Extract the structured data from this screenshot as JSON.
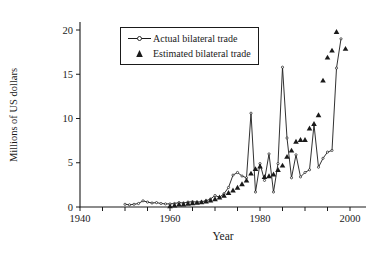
{
  "colors": {
    "ink": "#1a1a1a",
    "background": "#ffffff"
  },
  "legend": {
    "items": [
      {
        "label": "Actual bilateral trade",
        "symbol": "line-with-open-circle"
      },
      {
        "label": "Estimated bilateral trade",
        "symbol": "filled-triangle"
      }
    ],
    "position": "top-center-in-plot"
  },
  "chart_data": {
    "type": "line",
    "title": "",
    "xlabel": "Year",
    "ylabel": "Millions of US dollars",
    "grid": false,
    "x_axis": {
      "tick_labels": [
        "1940",
        "1960",
        "1980",
        "2000"
      ],
      "minor_ticks": [
        1940,
        1945,
        1950,
        1955,
        1960,
        1965,
        1970,
        1975,
        1980,
        1985,
        1990,
        1995,
        2000
      ],
      "range": [
        1940,
        2003
      ]
    },
    "y_axis": {
      "ticks": [
        0,
        5,
        10,
        15,
        20
      ],
      "range": [
        0,
        21
      ]
    },
    "series": [
      {
        "name": "Actual bilateral trade",
        "type": "line",
        "marker": "open-circle",
        "x": [
          1950,
          1951,
          1952,
          1953,
          1954,
          1955,
          1956,
          1957,
          1958,
          1959,
          1960,
          1961,
          1962,
          1963,
          1964,
          1965,
          1966,
          1967,
          1968,
          1969,
          1970,
          1971,
          1972,
          1973,
          1974,
          1975,
          1976,
          1977,
          1978,
          1979,
          1980,
          1981,
          1982,
          1983,
          1984,
          1985,
          1986,
          1987,
          1988,
          1989,
          1990,
          1991,
          1992,
          1993,
          1994,
          1995,
          1996,
          1997,
          1998
        ],
        "values": [
          0.3,
          0.25,
          0.3,
          0.4,
          0.7,
          0.55,
          0.45,
          0.5,
          0.4,
          0.35,
          0.35,
          0.4,
          0.5,
          0.45,
          0.55,
          0.6,
          0.55,
          0.6,
          0.7,
          0.9,
          1.3,
          1.1,
          1.5,
          2.2,
          3.6,
          3.9,
          3.5,
          3.3,
          10.6,
          1.7,
          4.9,
          3.0,
          6.0,
          1.7,
          4.9,
          15.8,
          7.8,
          3.3,
          5.9,
          3.4,
          3.9,
          4.2,
          9.3,
          4.5,
          5.5,
          6.2,
          6.4,
          15.7,
          19.0
        ]
      },
      {
        "name": "Estimated bilateral trade",
        "type": "scatter",
        "marker": "filled-triangle",
        "x": [
          1960,
          1961,
          1962,
          1963,
          1964,
          1965,
          1966,
          1967,
          1968,
          1969,
          1970,
          1971,
          1972,
          1973,
          1974,
          1975,
          1976,
          1977,
          1978,
          1979,
          1980,
          1981,
          1982,
          1983,
          1984,
          1985,
          1986,
          1987,
          1988,
          1989,
          1990,
          1991,
          1992,
          1993,
          1994,
          1995,
          1996,
          1997,
          1999
        ],
        "values": [
          0.1,
          0.2,
          0.3,
          0.3,
          0.4,
          0.45,
          0.5,
          0.55,
          0.65,
          0.75,
          0.9,
          1.1,
          1.3,
          1.6,
          1.9,
          2.2,
          2.6,
          3.0,
          3.8,
          4.3,
          4.6,
          3.4,
          3.5,
          3.7,
          4.2,
          4.7,
          5.7,
          6.4,
          7.4,
          7.6,
          7.6,
          8.9,
          9.4,
          10.4,
          14.3,
          16.9,
          17.7,
          19.8,
          17.9
        ]
      }
    ]
  }
}
